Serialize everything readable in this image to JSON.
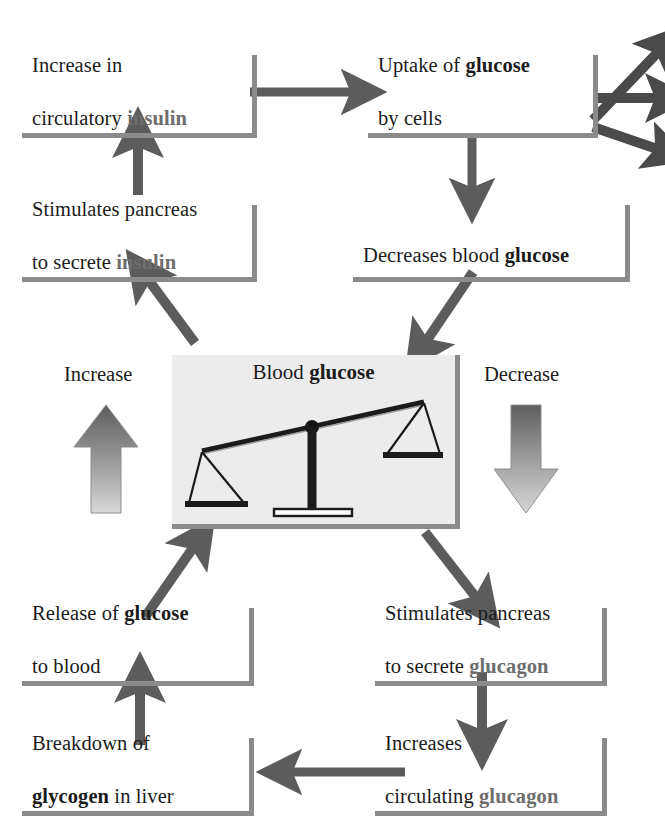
{
  "diagram": {
    "colors": {
      "rule": "#8b8b8b",
      "arrow": "#5c5c5c",
      "arrow_dark": "#4a4a4a",
      "panel_bg": "#ececed",
      "text": "#1b1b1b",
      "keyword_grey": "#6d6d6d",
      "big_arrow_top": "#5e5e5e",
      "big_arrow_bottom": "#d6d6d6"
    },
    "center_panel": {
      "title_plain": "Blood ",
      "title_keyword": "glucose",
      "icon": "balance-scale-tilted-left"
    },
    "side_labels": {
      "increase": "Increase",
      "decrease": "Decrease"
    },
    "nodes": [
      {
        "id": "increase-insulin",
        "line1_plain": "Increase in",
        "line2_plain": "circulatory ",
        "line2_keyword": "insulin",
        "keyword_style": "grey"
      },
      {
        "id": "uptake-glucose",
        "line1_plain": "Uptake of ",
        "line1_keyword": "glucose",
        "line2_plain": "by cells",
        "keyword_style": "dark"
      },
      {
        "id": "stimulates-insulin",
        "line1_plain": "Stimulates pancreas",
        "line2_plain": "to secrete ",
        "line2_keyword": "insulin",
        "keyword_style": "grey"
      },
      {
        "id": "decreases-blood-glucose",
        "line1_plain": "Decreases blood ",
        "line1_keyword": "glucose",
        "line2_plain": "",
        "keyword_style": "dark"
      },
      {
        "id": "release-glucose",
        "line1_plain": "Release of ",
        "line1_keyword": "glucose",
        "line2_plain": "to blood",
        "keyword_style": "dark"
      },
      {
        "id": "stimulates-glucagon",
        "line1_plain": "Stimulates pancreas",
        "line2_plain": "to secrete ",
        "line2_keyword": "glucagon",
        "keyword_style": "grey"
      },
      {
        "id": "breakdown-glycogen",
        "line1_plain": "Breakdown of",
        "line2_keyword": "glycogen",
        "line2_plain": " in liver",
        "keyword_style": "dark"
      },
      {
        "id": "increases-glucagon",
        "line1_plain": "Increases",
        "line2_plain": "circulating ",
        "line2_keyword": "glucagon",
        "keyword_style": "grey"
      }
    ],
    "flow_edges": [
      "increase-insulin -> uptake-glucose",
      "uptake-glucose -> three fanned arrows to tissues (off-page right)",
      "uptake-glucose -> decreases-blood-glucose",
      "decreases-blood-glucose -> blood glucose panel",
      "blood glucose panel -> stimulates-glucagon",
      "stimulates-glucagon -> increases-glucagon",
      "increases-glucagon -> breakdown-glycogen",
      "breakdown-glycogen -> release-glucose",
      "release-glucose -> blood glucose panel",
      "blood glucose panel -> stimulates-insulin",
      "stimulates-insulin -> increase-insulin"
    ]
  }
}
